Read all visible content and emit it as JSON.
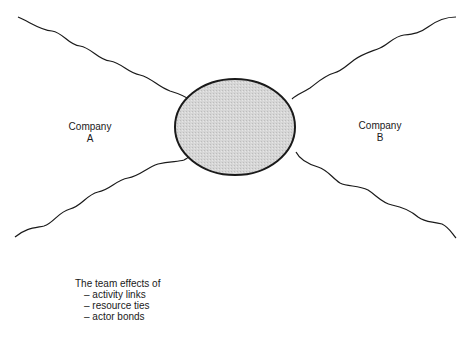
{
  "diagram": {
    "center": {
      "shape": "ellipse",
      "fill": "#d4d4d4",
      "stroke": "#1a1a1a"
    },
    "nodes": [
      {
        "id": "company-a",
        "line1": "Company",
        "line2": "A"
      },
      {
        "id": "company-b",
        "line1": "Company",
        "line2": "B"
      }
    ],
    "connectors": [
      "upper-left wavy line",
      "lower-left wavy line",
      "upper-right wavy line",
      "lower-right wavy line"
    ],
    "caption": {
      "title": "The team effects of",
      "items": [
        "– activity links",
        "– resource ties",
        "– actor bonds"
      ]
    }
  }
}
